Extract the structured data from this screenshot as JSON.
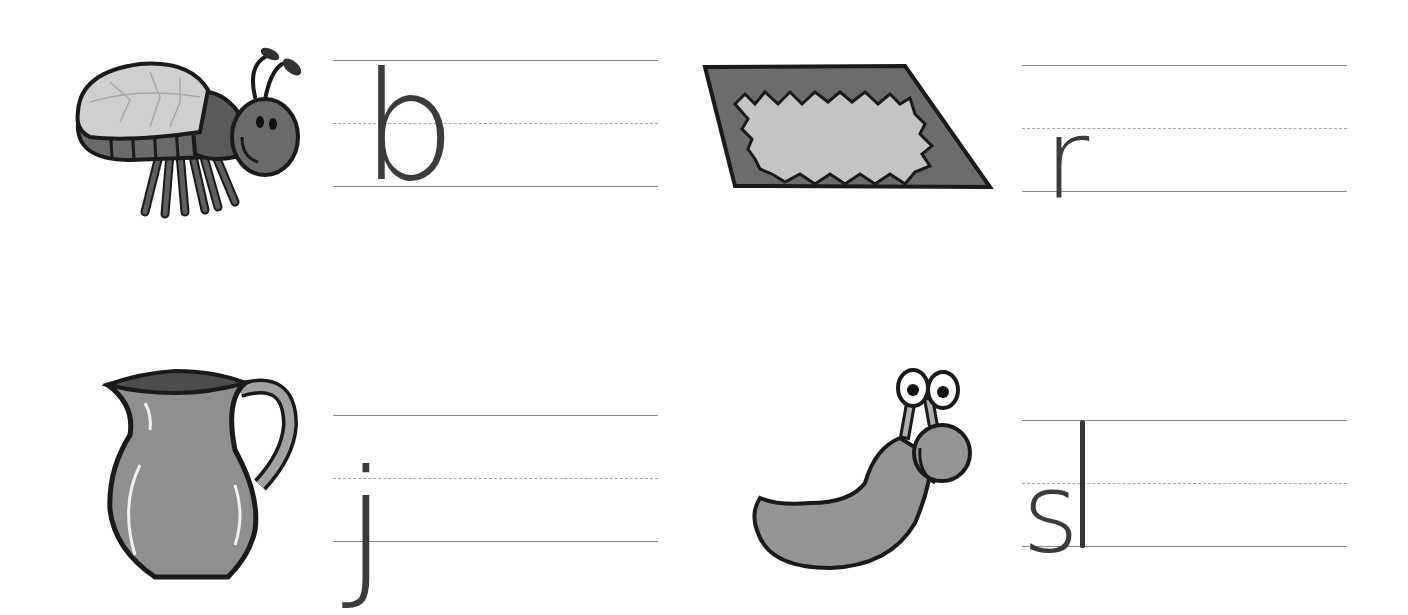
{
  "worksheet": {
    "items": [
      {
        "picture": "bug",
        "letters": "b",
        "has_extra_stroke": false
      },
      {
        "picture": "rug",
        "letters": "r",
        "has_extra_stroke": false
      },
      {
        "picture": "jug",
        "letters": "j",
        "has_extra_stroke": false
      },
      {
        "picture": "slug",
        "letters": "s",
        "has_extra_stroke": true
      }
    ]
  },
  "colors": {
    "outline": "#1a1a1a",
    "dark_gray": "#5e5e5e",
    "mid_gray": "#8e8e8e",
    "light_gray": "#c8c8c8",
    "rule_solid": "#8a8a8a",
    "rule_dashed": "#a8a8a8",
    "letter": "#3b3b3b"
  }
}
